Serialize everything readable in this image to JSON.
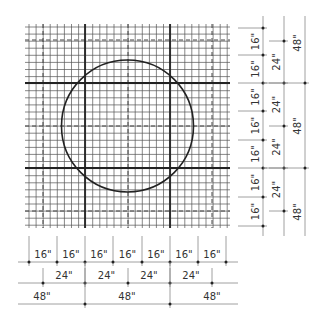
{
  "diagram": {
    "title": "",
    "colors": {
      "background": "#ffffff",
      "fine_grid": "#555555",
      "major_grid": "#222222",
      "dashed_grid": "#444444",
      "circle": "#222222",
      "dimension_line": "#888888",
      "label": "#333333"
    },
    "grid": {
      "left": 25,
      "right": 230,
      "top": 24,
      "bottom": 228,
      "origin_x": 29,
      "origin_y": 27,
      "fine_step": 7.08,
      "fine_unit": "4\""
    },
    "circle": {
      "cx": 127.5,
      "cy": 126,
      "r": 66
    },
    "major_lines": {
      "vertical": [
        85,
        170
      ],
      "horizontal": [
        83,
        168
      ]
    },
    "dashed_lines": {
      "vertical": [
        43,
        128,
        212
      ],
      "horizontal": [
        40,
        126,
        211
      ]
    },
    "bottom_dimensions": {
      "row_16": {
        "y": 262,
        "ticks": [
          29,
          57,
          85,
          113,
          142,
          170,
          198,
          226
        ],
        "labels": [
          "16\"",
          "16\"",
          "16\"",
          "16\"",
          "16\"",
          "16\"",
          "16\""
        ]
      },
      "row_24": {
        "y": 283,
        "ticks": [
          43,
          85,
          128,
          170,
          212
        ],
        "labels": [
          "24\"",
          "24\"",
          "24\"",
          "24\""
        ]
      },
      "row_48": {
        "y": 304,
        "ticks": [
          85,
          170
        ],
        "labels": [
          "48\"",
          "48\"",
          "48\""
        ],
        "label_x": [
          42,
          127,
          212
        ]
      }
    },
    "right_dimensions": {
      "col_16": {
        "x": 263,
        "ticks": [
          28,
          55,
          83,
          111,
          140,
          168,
          197,
          226
        ],
        "labels": [
          "16\"",
          "16\"",
          "16\"",
          "16\"",
          "16\"",
          "16\"",
          "16\""
        ]
      },
      "col_24": {
        "x": 284,
        "ticks": [
          41,
          83,
          126,
          168,
          211
        ],
        "labels": [
          "24\"",
          "24\"",
          "24\"",
          "24\""
        ]
      },
      "col_48": {
        "x": 305,
        "ticks": [
          83,
          168
        ],
        "labels": [
          "48\"",
          "48\"",
          "48\""
        ],
        "label_y": [
          43,
          126,
          212
        ]
      }
    }
  }
}
